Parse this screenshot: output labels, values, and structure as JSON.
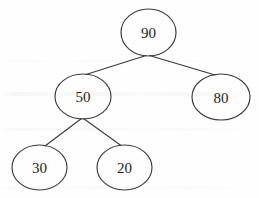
{
  "figure": {
    "type": "binary-tree",
    "background_color": "#fefefe",
    "stroke_color": "#3a3a3a",
    "text_color": "#1d1d1d"
  },
  "tree": {
    "root_label": "90",
    "nodes": [
      {
        "id": "n90",
        "label": "90",
        "cx": 148.5,
        "cy": 32.5,
        "rx": 27.5,
        "ry": 23.5,
        "level": 0,
        "role": "root"
      },
      {
        "id": "n50",
        "label": "50",
        "cx": 83.0,
        "cy": 96.5,
        "rx": 28.0,
        "ry": 22.5,
        "level": 1,
        "role": "left-child"
      },
      {
        "id": "n80",
        "label": "80",
        "cx": 221.0,
        "cy": 97.0,
        "rx": 29.0,
        "ry": 23.0,
        "level": 1,
        "role": "right-child"
      },
      {
        "id": "n30",
        "label": "30",
        "cx": 39.5,
        "cy": 167.5,
        "rx": 27.5,
        "ry": 22.5,
        "level": 2,
        "role": "left-child"
      },
      {
        "id": "n20",
        "label": "20",
        "cx": 124.5,
        "cy": 167.5,
        "rx": 27.5,
        "ry": 22.5,
        "level": 2,
        "role": "right-child"
      }
    ],
    "edges": [
      {
        "id": "e90-50",
        "from": "90",
        "to": "50",
        "x1": 146.0,
        "y1": 55.5,
        "x2": 86.0,
        "y2": 74.5
      },
      {
        "id": "e90-80",
        "from": "90",
        "to": "80",
        "x1": 149.5,
        "y1": 55.5,
        "x2": 215.0,
        "y2": 75.0
      },
      {
        "id": "e50-30",
        "from": "50",
        "to": "30",
        "x1": 81.5,
        "y1": 118.5,
        "x2": 45.0,
        "y2": 146.0
      },
      {
        "id": "e50-20",
        "from": "50",
        "to": "20",
        "x1": 83.5,
        "y1": 118.5,
        "x2": 121.0,
        "y2": 145.5
      }
    ]
  },
  "chart_data": {
    "type": "diagram",
    "subtype": "binary-tree",
    "title": "",
    "node_labels": [
      "90",
      "50",
      "80",
      "30",
      "20"
    ],
    "node_values": [
      90,
      50,
      80,
      30,
      20
    ],
    "adjacency": [
      {
        "parent": "90",
        "children": [
          "50",
          "80"
        ]
      },
      {
        "parent": "50",
        "children": [
          "30",
          "20"
        ]
      },
      {
        "parent": "80",
        "children": []
      },
      {
        "parent": "30",
        "children": []
      },
      {
        "parent": "20",
        "children": []
      }
    ],
    "levels": [
      [
        "90"
      ],
      [
        "50",
        "80"
      ],
      [
        "30",
        "20"
      ]
    ],
    "node_count": 5,
    "edge_count": 4,
    "height": 2,
    "grid": false,
    "legend": false
  }
}
